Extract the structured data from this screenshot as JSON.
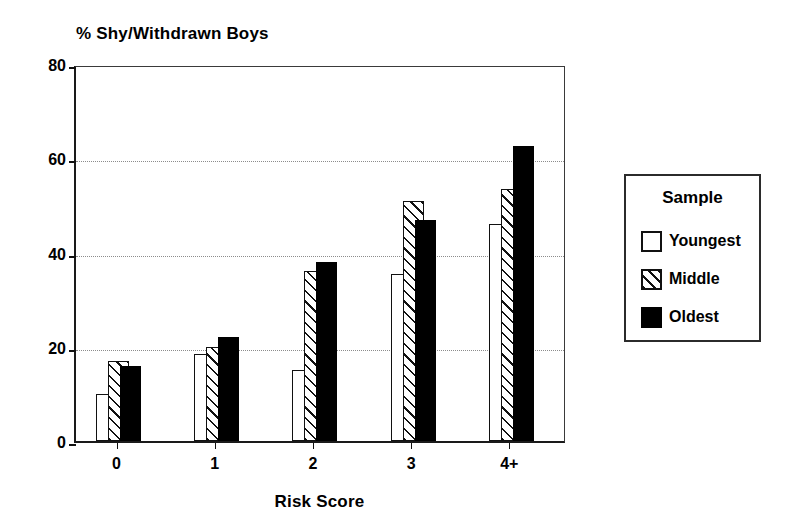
{
  "chart_data": {
    "type": "bar",
    "title": "% Shy/Withdrawn Boys",
    "xlabel": "Risk Score",
    "ylabel": "",
    "categories": [
      "0",
      "1",
      "2",
      "3",
      "4+"
    ],
    "ylim": [
      0,
      80
    ],
    "yticks": [
      0,
      20,
      40,
      60,
      80
    ],
    "ytick_labels": [
      "0",
      "20",
      "40",
      "60",
      "80"
    ],
    "grid": "horizontal-dotted-at-20-40-60",
    "legend_position": "right-outside",
    "legend_title": "Sample",
    "series": [
      {
        "name": "Youngest",
        "fill": "white",
        "color": "#ffffff",
        "values": [
          10,
          18.5,
          15,
          35.5,
          46
        ]
      },
      {
        "name": "Middle",
        "fill": "diagonal-hatch",
        "color": "#ffffff",
        "values": [
          17,
          20,
          36,
          51,
          53.5
        ]
      },
      {
        "name": "Oldest",
        "fill": "solid-black",
        "color": "#000000",
        "values": [
          16,
          22,
          38,
          47,
          62.5
        ]
      }
    ]
  },
  "legend": {
    "title": "Sample",
    "items": [
      {
        "label": "Youngest",
        "swatch": "white-square-icon"
      },
      {
        "label": "Middle",
        "swatch": "hatched-square-icon"
      },
      {
        "label": "Oldest",
        "swatch": "black-square-icon"
      }
    ]
  }
}
